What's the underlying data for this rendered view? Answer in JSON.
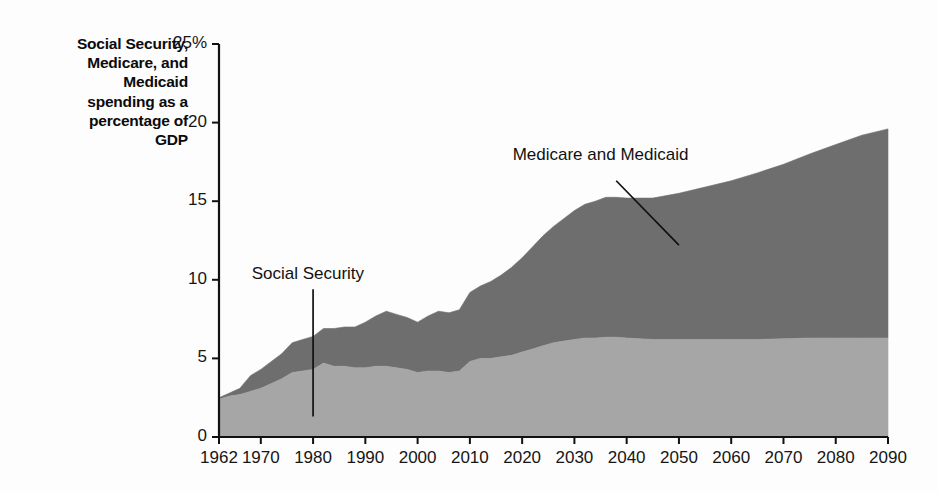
{
  "figure": {
    "axis_title": [
      "Social Security,",
      "Medicare, and",
      "Medicaid",
      "spending as a",
      "percentage of",
      "GDP"
    ],
    "background_color": "#fdfdfd",
    "axis_color": "#111111"
  },
  "chart_data": {
    "type": "area",
    "stacked": true,
    "title": "Social Security, Medicare, and Medicaid spending as a percentage of GDP",
    "xlabel": "",
    "ylabel": "Social Security, Medicare, and Medicaid spending as a percentage of GDP",
    "xlim": [
      1962,
      2090
    ],
    "ylim": [
      0,
      25
    ],
    "grid": false,
    "legend_position": "inline-annotations",
    "ytick_labels": [
      "0",
      "5",
      "10",
      "15",
      "20",
      "25%"
    ],
    "ytick_values": [
      0,
      5,
      10,
      15,
      20,
      25
    ],
    "xtick_labels": [
      "1962",
      "1970",
      "1980",
      "1990",
      "2000",
      "2010",
      "2020",
      "2030",
      "2040",
      "2050",
      "2060",
      "2070",
      "2080",
      "2090"
    ],
    "xtick_values": [
      1962,
      1970,
      1980,
      1990,
      2000,
      2010,
      2020,
      2030,
      2040,
      2050,
      2060,
      2070,
      2080,
      2090
    ],
    "colors": {
      "social_security": "#a6a6a6",
      "medicare_medicaid": "#6e6e6e"
    },
    "annotations": [
      {
        "text": "Social Security",
        "text_x": 1979,
        "text_y": 10.3,
        "leader_from": [
          1980,
          9.4
        ],
        "leader_to": [
          1980,
          1.3
        ]
      },
      {
        "text": "Medicare and Medicaid",
        "text_x": 2035,
        "text_y": 17.9,
        "leader_from": [
          2038,
          16.3
        ],
        "leader_to": [
          2050,
          12.2
        ]
      }
    ],
    "x": [
      1962,
      1964,
      1966,
      1968,
      1970,
      1972,
      1974,
      1976,
      1978,
      1980,
      1982,
      1984,
      1986,
      1988,
      1990,
      1992,
      1994,
      1996,
      1998,
      2000,
      2002,
      2004,
      2006,
      2008,
      2010,
      2012,
      2014,
      2016,
      2018,
      2020,
      2022,
      2024,
      2026,
      2028,
      2030,
      2032,
      2034,
      2036,
      2038,
      2040,
      2045,
      2050,
      2055,
      2060,
      2065,
      2070,
      2075,
      2080,
      2085,
      2090
    ],
    "series": [
      {
        "name": "Social Security",
        "values": [
          2.4,
          2.6,
          2.7,
          2.9,
          3.1,
          3.4,
          3.7,
          4.1,
          4.2,
          4.3,
          4.7,
          4.5,
          4.5,
          4.4,
          4.4,
          4.5,
          4.5,
          4.4,
          4.3,
          4.1,
          4.2,
          4.2,
          4.1,
          4.2,
          4.8,
          5.0,
          5.0,
          5.1,
          5.2,
          5.4,
          5.6,
          5.8,
          6.0,
          6.1,
          6.2,
          6.3,
          6.3,
          6.35,
          6.35,
          6.3,
          6.2,
          6.2,
          6.2,
          6.2,
          6.2,
          6.25,
          6.3,
          6.3,
          6.3,
          6.3
        ]
      },
      {
        "name": "Medicare and Medicaid",
        "values": [
          0.1,
          0.2,
          0.4,
          1.0,
          1.2,
          1.4,
          1.6,
          1.9,
          2.0,
          2.1,
          2.2,
          2.4,
          2.5,
          2.6,
          2.9,
          3.2,
          3.5,
          3.4,
          3.3,
          3.2,
          3.5,
          3.8,
          3.8,
          3.9,
          4.4,
          4.6,
          4.9,
          5.2,
          5.6,
          6.0,
          6.5,
          7.0,
          7.4,
          7.8,
          8.2,
          8.5,
          8.7,
          8.9,
          8.9,
          8.9,
          9.0,
          9.3,
          9.7,
          10.1,
          10.6,
          11.1,
          11.7,
          12.3,
          12.9,
          13.3
        ]
      }
    ],
    "totals": [
      2.5,
      2.8,
      3.1,
      3.9,
      4.3,
      4.8,
      5.3,
      6.0,
      6.2,
      6.4,
      6.9,
      6.9,
      7.0,
      7.0,
      7.3,
      7.7,
      8.0,
      7.8,
      7.6,
      7.3,
      7.7,
      8.0,
      7.9,
      8.1,
      9.2,
      9.6,
      9.9,
      10.3,
      10.8,
      11.4,
      12.1,
      12.8,
      13.4,
      13.9,
      14.4,
      14.8,
      15.0,
      15.25,
      15.25,
      15.2,
      15.2,
      15.5,
      15.9,
      16.3,
      16.8,
      17.35,
      18.0,
      18.6,
      19.2,
      19.6
    ]
  }
}
